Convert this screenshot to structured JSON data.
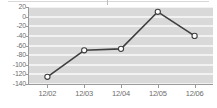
{
  "chart_data": {
    "type": "line",
    "title": "",
    "subtitle": "",
    "xlabel": "",
    "ylabel": "",
    "categories": [
      "12/02",
      "12/03",
      "12/04",
      "12/05",
      "12/06"
    ],
    "values": [
      -125,
      -70,
      -67,
      10,
      -40
    ],
    "series": [
      {
        "name": "",
        "values": [
          -125,
          -70,
          -67,
          10,
          -40
        ]
      }
    ],
    "ylim": [
      -140,
      20
    ],
    "yticks": [
      20,
      0,
      -20,
      -40,
      -60,
      -80,
      -100,
      -120,
      -140
    ],
    "ytick_labels": [
      "20",
      "0",
      "-20",
      "-40",
      "-60",
      "-80",
      "-100",
      "-120",
      "-140"
    ],
    "xtick_labels": [
      "12/02",
      "12/03",
      "12/04",
      "12/05",
      "12/06"
    ],
    "grid": true,
    "grid_orientation": "horizontal",
    "legend": false,
    "legend_position": "none",
    "marker": "circle-open",
    "colors": {
      "line": "#3f3f3f",
      "marker_fill": "#ffffff",
      "marker_stroke": "#3f3f3f",
      "plot_background": "#d9d9d9",
      "gridline": "#f2f2f2",
      "axis": "#9a9a9a",
      "tick_text": "#6d6d6d"
    }
  }
}
